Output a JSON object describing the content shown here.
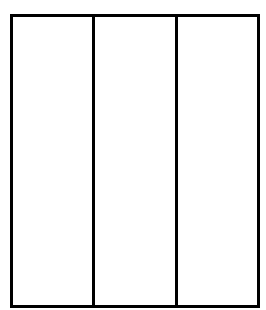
{
  "diagram": {
    "type": "vertical-column-divisions",
    "columns": [
      {
        "index": 1,
        "label": ""
      },
      {
        "index": 2,
        "label": ""
      },
      {
        "index": 3,
        "label": ""
      }
    ],
    "column_count": 3,
    "colors": {
      "stroke": "#000000",
      "fill": "#ffffff",
      "background": "#ffffff"
    }
  }
}
